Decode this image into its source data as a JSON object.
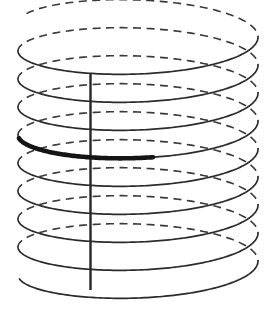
{
  "figure": {
    "kind": "helix-diagram",
    "title": "Helix with highlighted arc segment",
    "background_color": "#ffffff",
    "width": 276,
    "height": 313
  },
  "geometry": {
    "center_x": 138,
    "radius_x": 120,
    "radius_y": 30,
    "top_y": 37,
    "turns": 9,
    "pitch": 28,
    "start_angle_deg": 20
  },
  "strokes": {
    "front_color": "#2b2b2b",
    "front_width": 1.7,
    "back_color": "#3a3a3a",
    "back_width": 1.6,
    "back_dash": "8 5.5",
    "axis_color": "#262626",
    "axis_width": 2.4,
    "highlight_color": "#141414",
    "highlight_width": 4.6
  },
  "axis": {
    "name": "vertical-axis",
    "x": 90.5,
    "y_top": 73,
    "y_bottom": 290
  },
  "highlight": {
    "name": "bold-arc-segment",
    "turn_index": 4,
    "start_x": 33,
    "start_y": 137,
    "end_x": 138,
    "end_y": 164
  },
  "labels": {
    "figure_caption": ""
  }
}
